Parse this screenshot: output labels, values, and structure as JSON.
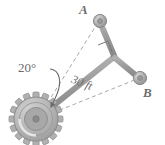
{
  "figure": {
    "type": "mechanism-diagram",
    "colors": {
      "line": "#8c8c8c",
      "link": "#9a9a9a",
      "gear_body": "#b3b3b3",
      "gear_hub": "#a0a0a0",
      "text": "#6d6d6d",
      "background": "#ffffff"
    },
    "labels": {
      "point_a": "A",
      "point_b": "B",
      "angle": "20°",
      "length": "30 ft"
    },
    "geometry": {
      "gear_center": [
        36,
        119
      ],
      "gear_outer_radius": 27,
      "gear_root_radius": 22,
      "gear_hub_radius": 12,
      "gear_teeth": 16,
      "joint_a": [
        100,
        21
      ],
      "joint_b": [
        140,
        78
      ],
      "elbow": [
        113,
        56
      ],
      "crank_end": [
        113,
        56
      ],
      "right_angle_marker": [
        104,
        52
      ],
      "dashed_a_from": [
        40,
        116
      ],
      "dashed_b_to": [
        138,
        79
      ],
      "angle_value_deg": 20,
      "length_value_ft": 30
    },
    "icons": {
      "joint": "pin-joint-icon",
      "gear": "gear-icon",
      "right_angle": "right-angle-marker-icon",
      "arrow": "curved-arrow-icon"
    }
  }
}
